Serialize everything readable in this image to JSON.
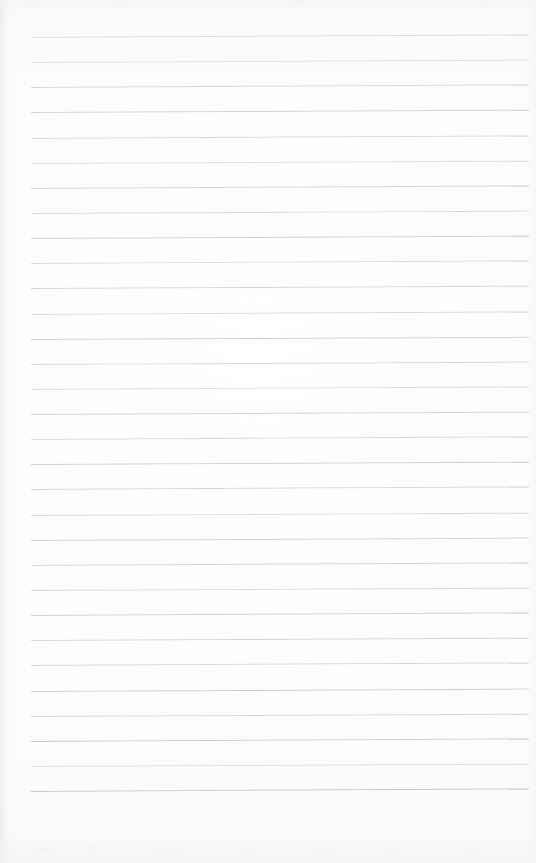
{
  "document": {
    "kind": "scanned-ruled-notebook-page",
    "title": "Blank Lined Notebook Page",
    "content_text": "",
    "page_width": 536,
    "page_height": 863,
    "paper_color": "#fdfdfd",
    "rule_color": "#b9bdc3",
    "rule_thickness_px": 1,
    "rule_spacing_px": 25.13,
    "rule_left_px": 31,
    "rule_right_px": 529,
    "first_rule_y_px": 37,
    "last_rule_y_px": 791,
    "rule_count": 31,
    "page_tilt_deg": -0.28,
    "bottom_blank_margin_px": 72,
    "has_vertical_margin_rule": false,
    "has_handwriting": false,
    "rules": [
      {
        "y": 37.0,
        "opacity": 0.55,
        "tilt": -0.3
      },
      {
        "y": 62.1,
        "opacity": 0.48,
        "tilt": -0.28
      },
      {
        "y": 87.3,
        "opacity": 0.62,
        "tilt": -0.3
      },
      {
        "y": 112.4,
        "opacity": 0.7,
        "tilt": -0.26
      },
      {
        "y": 137.5,
        "opacity": 0.58,
        "tilt": -0.29
      },
      {
        "y": 162.7,
        "opacity": 0.52,
        "tilt": -0.27
      },
      {
        "y": 187.8,
        "opacity": 0.66,
        "tilt": -0.3
      },
      {
        "y": 212.9,
        "opacity": 0.6,
        "tilt": -0.28
      },
      {
        "y": 238.1,
        "opacity": 0.72,
        "tilt": -0.26
      },
      {
        "y": 263.2,
        "opacity": 0.56,
        "tilt": -0.29
      },
      {
        "y": 288.3,
        "opacity": 0.64,
        "tilt": -0.27
      },
      {
        "y": 313.5,
        "opacity": 0.58,
        "tilt": -0.3
      },
      {
        "y": 338.6,
        "opacity": 0.74,
        "tilt": -0.25
      },
      {
        "y": 363.7,
        "opacity": 0.62,
        "tilt": -0.28
      },
      {
        "y": 388.9,
        "opacity": 0.55,
        "tilt": -0.3
      },
      {
        "y": 414.0,
        "opacity": 0.68,
        "tilt": -0.26
      },
      {
        "y": 439.1,
        "opacity": 0.6,
        "tilt": -0.29
      },
      {
        "y": 464.3,
        "opacity": 0.76,
        "tilt": -0.27
      },
      {
        "y": 489.4,
        "opacity": 0.63,
        "tilt": -0.3
      },
      {
        "y": 514.5,
        "opacity": 0.57,
        "tilt": -0.26
      },
      {
        "y": 539.7,
        "opacity": 0.7,
        "tilt": -0.28
      },
      {
        "y": 564.8,
        "opacity": 0.65,
        "tilt": -0.3
      },
      {
        "y": 589.9,
        "opacity": 0.59,
        "tilt": -0.27
      },
      {
        "y": 615.1,
        "opacity": 0.73,
        "tilt": -0.29
      },
      {
        "y": 640.2,
        "opacity": 0.66,
        "tilt": -0.26
      },
      {
        "y": 665.3,
        "opacity": 0.61,
        "tilt": -0.3
      },
      {
        "y": 690.5,
        "opacity": 0.78,
        "tilt": -0.28
      },
      {
        "y": 715.6,
        "opacity": 0.64,
        "tilt": -0.27
      },
      {
        "y": 740.7,
        "opacity": 0.8,
        "tilt": -0.3
      },
      {
        "y": 765.9,
        "opacity": 0.5,
        "tilt": -0.26
      },
      {
        "y": 791.0,
        "opacity": 0.85,
        "tilt": -0.29
      }
    ]
  }
}
